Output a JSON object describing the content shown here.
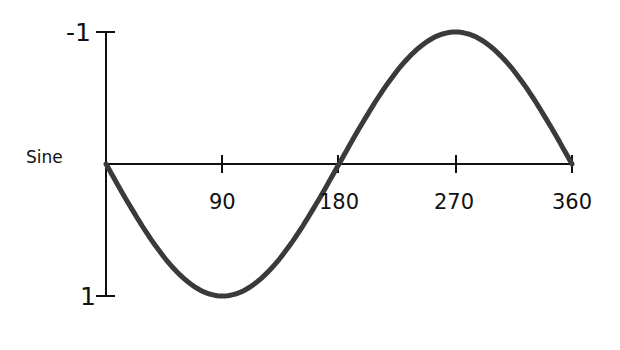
{
  "chart_data": {
    "type": "line",
    "title": "Sine",
    "xlabel": "",
    "ylabel": "Sine",
    "x": [
      0,
      90,
      180,
      270,
      360
    ],
    "series": [
      {
        "name": "Sine",
        "values": [
          0,
          1,
          0,
          -1,
          0
        ]
      }
    ],
    "x_tick_labels": [
      "90",
      "180",
      "270",
      "360"
    ],
    "y_tick_labels": [
      "-1",
      "1"
    ],
    "xlim": [
      0,
      360
    ],
    "ylim": [
      1,
      -1
    ],
    "y_axis_inverted": true,
    "grid": false,
    "legend": "none",
    "colors": {
      "curve": "#3a3a3a",
      "axes": "#111111"
    }
  },
  "labels": {
    "series_label": "Sine",
    "y_top": "-1",
    "y_bottom": "1",
    "x_90": "90",
    "x_180": "180",
    "x_270": "270",
    "x_360": "360"
  }
}
